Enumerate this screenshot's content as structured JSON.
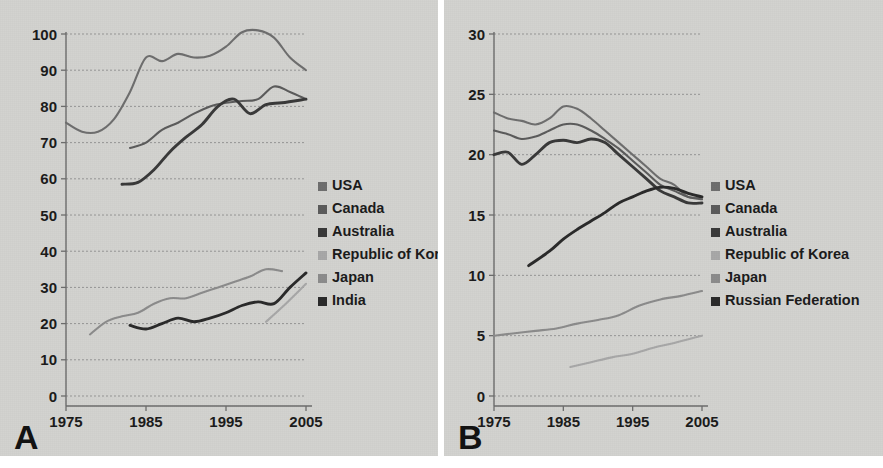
{
  "figure": {
    "background": "#d3d3d0",
    "panel_a_letter": "A",
    "panel_b_letter": "B"
  },
  "chart_data": [
    {
      "panel": "A",
      "type": "line",
      "title": "",
      "xlabel": "",
      "ylabel": "",
      "xlim": [
        1975,
        2005
      ],
      "ylim": [
        0,
        100
      ],
      "xticks": [
        1975,
        1985,
        1995,
        2005
      ],
      "yticks": [
        0,
        10,
        20,
        30,
        40,
        50,
        60,
        70,
        80,
        90,
        100
      ],
      "grid": true,
      "legend_position": "right",
      "colors": {
        "USA": "#6f6f6f",
        "Canada": "#5c5c5c",
        "Australia": "#3a3a3a",
        "Republic of Korea": "#a8a8a8",
        "Japan": "#8c8c8c",
        "India": "#2b2b2b"
      },
      "series": [
        {
          "name": "USA",
          "x": [
            1975,
            1977,
            1979,
            1981,
            1983,
            1985,
            1987,
            1989,
            1991,
            1993,
            1995,
            1997,
            1999,
            2001,
            2003,
            2005
          ],
          "values": [
            75.5,
            73.0,
            73.0,
            76.5,
            84.0,
            93.5,
            92.5,
            94.5,
            93.5,
            94.0,
            96.5,
            100.5,
            101.0,
            99.0,
            93.5,
            90.0
          ]
        },
        {
          "name": "Canada",
          "x": [
            1983,
            1985,
            1987,
            1989,
            1991,
            1993,
            1995,
            1997,
            1999,
            2001,
            2003,
            2005
          ],
          "values": [
            68.5,
            70.0,
            73.5,
            75.5,
            78.0,
            80.0,
            81.0,
            81.5,
            82.0,
            85.5,
            84.0,
            82.0
          ]
        },
        {
          "name": "Australia",
          "x": [
            1982,
            1984,
            1986,
            1988,
            1990,
            1992,
            1994,
            1996,
            1998,
            2000,
            2002,
            2005
          ],
          "values": [
            58.5,
            59.0,
            62.5,
            67.5,
            71.5,
            75.0,
            80.0,
            82.0,
            78.0,
            80.5,
            81.0,
            82.0
          ]
        },
        {
          "name": "Japan",
          "x": [
            1978,
            1980,
            1982,
            1984,
            1986,
            1988,
            1990,
            1992,
            1994,
            1996,
            1998,
            2000,
            2002
          ],
          "values": [
            17.0,
            20.5,
            22.0,
            23.0,
            25.5,
            27.0,
            27.0,
            28.5,
            30.0,
            31.5,
            33.0,
            35.0,
            34.5
          ]
        },
        {
          "name": "India",
          "x": [
            1983,
            1985,
            1987,
            1989,
            1991,
            1993,
            1995,
            1997,
            1999,
            2001,
            2003,
            2005
          ],
          "values": [
            19.5,
            18.5,
            20.0,
            21.5,
            20.5,
            21.5,
            23.0,
            25.0,
            26.0,
            25.5,
            30.0,
            34.0
          ]
        },
        {
          "name": "Republic of Korea",
          "x": [
            2000,
            2002,
            2005
          ],
          "values": [
            20.5,
            24.5,
            31.0
          ]
        }
      ]
    },
    {
      "panel": "B",
      "type": "line",
      "title": "",
      "xlabel": "",
      "ylabel": "",
      "xlim": [
        1975,
        2005
      ],
      "ylim": [
        0,
        30
      ],
      "xticks": [
        1975,
        1985,
        1995,
        2005
      ],
      "yticks": [
        0,
        5,
        10,
        15,
        20,
        25,
        30
      ],
      "grid": true,
      "legend_position": "right",
      "colors": {
        "USA": "#6f6f6f",
        "Canada": "#5c5c5c",
        "Australia": "#3a3a3a",
        "Republic of Korea": "#a8a8a8",
        "Japan": "#8c8c8c",
        "Russian Federation": "#2b2b2b"
      },
      "series": [
        {
          "name": "USA",
          "x": [
            1975,
            1977,
            1979,
            1981,
            1983,
            1985,
            1987,
            1989,
            1991,
            1993,
            1995,
            1997,
            1999,
            2001,
            2003,
            2005
          ],
          "values": [
            23.5,
            23.0,
            22.8,
            22.5,
            23.0,
            24.0,
            23.8,
            23.0,
            22.0,
            21.0,
            20.0,
            19.0,
            18.0,
            17.5,
            16.5,
            16.5
          ]
        },
        {
          "name": "Canada",
          "x": [
            1975,
            1977,
            1979,
            1981,
            1983,
            1985,
            1987,
            1989,
            1991,
            1993,
            1995,
            1997,
            1999,
            2001,
            2003,
            2005
          ],
          "values": [
            22.0,
            21.7,
            21.3,
            21.5,
            22.0,
            22.5,
            22.5,
            22.0,
            21.3,
            20.5,
            19.5,
            18.5,
            17.5,
            17.0,
            16.5,
            16.3
          ]
        },
        {
          "name": "Australia",
          "x": [
            1975,
            1977,
            1979,
            1981,
            1983,
            1985,
            1987,
            1989,
            1991,
            1993,
            1995,
            1997,
            1999,
            2001,
            2003,
            2005
          ],
          "values": [
            20.0,
            20.2,
            19.2,
            20.0,
            21.0,
            21.2,
            21.0,
            21.3,
            21.0,
            20.0,
            19.0,
            18.0,
            17.0,
            16.5,
            16.0,
            16.0
          ]
        },
        {
          "name": "Russian Federation",
          "x": [
            1980,
            1983,
            1985,
            1987,
            1989,
            1991,
            1993,
            1995,
            1997,
            1999,
            2001,
            2003,
            2005
          ],
          "values": [
            10.8,
            12.0,
            13.0,
            13.8,
            14.5,
            15.2,
            16.0,
            16.5,
            17.0,
            17.3,
            17.2,
            16.8,
            16.5
          ]
        },
        {
          "name": "Japan",
          "x": [
            1975,
            1978,
            1981,
            1984,
            1987,
            1990,
            1993,
            1996,
            1999,
            2002,
            2005
          ],
          "values": [
            5.0,
            5.2,
            5.4,
            5.6,
            6.0,
            6.3,
            6.7,
            7.5,
            8.0,
            8.3,
            8.7
          ]
        },
        {
          "name": "Republic of Korea",
          "x": [
            1986,
            1989,
            1992,
            1995,
            1998,
            2001,
            2005
          ],
          "values": [
            2.4,
            2.8,
            3.2,
            3.5,
            4.0,
            4.4,
            5.0
          ]
        }
      ]
    }
  ],
  "panel_a": {
    "letter": "A",
    "x_tick_labels": [
      "1975",
      "1985",
      "1995",
      "2005"
    ],
    "y_tick_labels": [
      "0",
      "10",
      "20",
      "30",
      "40",
      "50",
      "60",
      "70",
      "80",
      "90",
      "100"
    ],
    "legend": [
      {
        "label": "USA",
        "color": "#6f6f6f"
      },
      {
        "label": "Canada",
        "color": "#5c5c5c"
      },
      {
        "label": "Australia",
        "color": "#3a3a3a"
      },
      {
        "label": "Republic of Korea",
        "color": "#a8a8a8"
      },
      {
        "label": "Japan",
        "color": "#8c8c8c"
      },
      {
        "label": "India",
        "color": "#2b2b2b"
      }
    ]
  },
  "panel_b": {
    "letter": "B",
    "x_tick_labels": [
      "1975",
      "1985",
      "1995",
      "2005"
    ],
    "y_tick_labels": [
      "0",
      "5",
      "10",
      "15",
      "20",
      "25",
      "30"
    ],
    "legend": [
      {
        "label": "USA",
        "color": "#6f6f6f"
      },
      {
        "label": "Canada",
        "color": "#5c5c5c"
      },
      {
        "label": "Australia",
        "color": "#3a3a3a"
      },
      {
        "label": "Republic of Korea",
        "color": "#a8a8a8"
      },
      {
        "label": "Japan",
        "color": "#8c8c8c"
      },
      {
        "label": "Russian Federation",
        "color": "#2b2b2b"
      }
    ]
  }
}
